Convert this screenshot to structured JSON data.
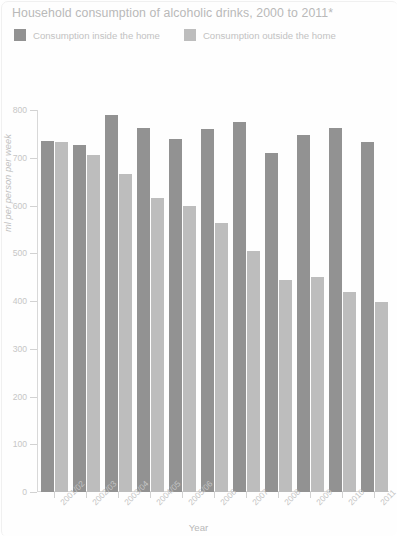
{
  "chart_data": {
    "type": "bar",
    "title": "Household consumption of alcoholic drinks, 2000 to 2011*",
    "xlabel": "Year",
    "ylabel": "ml per person per week",
    "ylim": [
      0,
      800
    ],
    "ytick_step": 100,
    "yticks": [
      "0",
      "100",
      "200",
      "300",
      "400",
      "500",
      "600",
      "700",
      "800"
    ],
    "grid": false,
    "legend_position": "top-left",
    "categories": [
      "2001/02",
      "2002/03",
      "2003/04",
      "2004/05",
      "2005/06",
      "2006",
      "2007",
      "2008",
      "2009",
      "2010",
      "2011"
    ],
    "series": [
      {
        "name": "Consumption inside the home",
        "color": "#929292",
        "values": [
          735,
          727,
          790,
          762,
          740,
          760,
          775,
          710,
          748,
          763,
          733
        ]
      },
      {
        "name": "Consumption outside the home",
        "color": "#bdbdbd",
        "values": [
          733,
          705,
          665,
          615,
          600,
          563,
          505,
          445,
          450,
          418,
          397
        ]
      }
    ]
  },
  "legend": {
    "items": [
      {
        "label": "Consumption inside the home",
        "color": "#929292"
      },
      {
        "label": "Consumption outside the home",
        "color": "#bdbdbd"
      }
    ]
  }
}
